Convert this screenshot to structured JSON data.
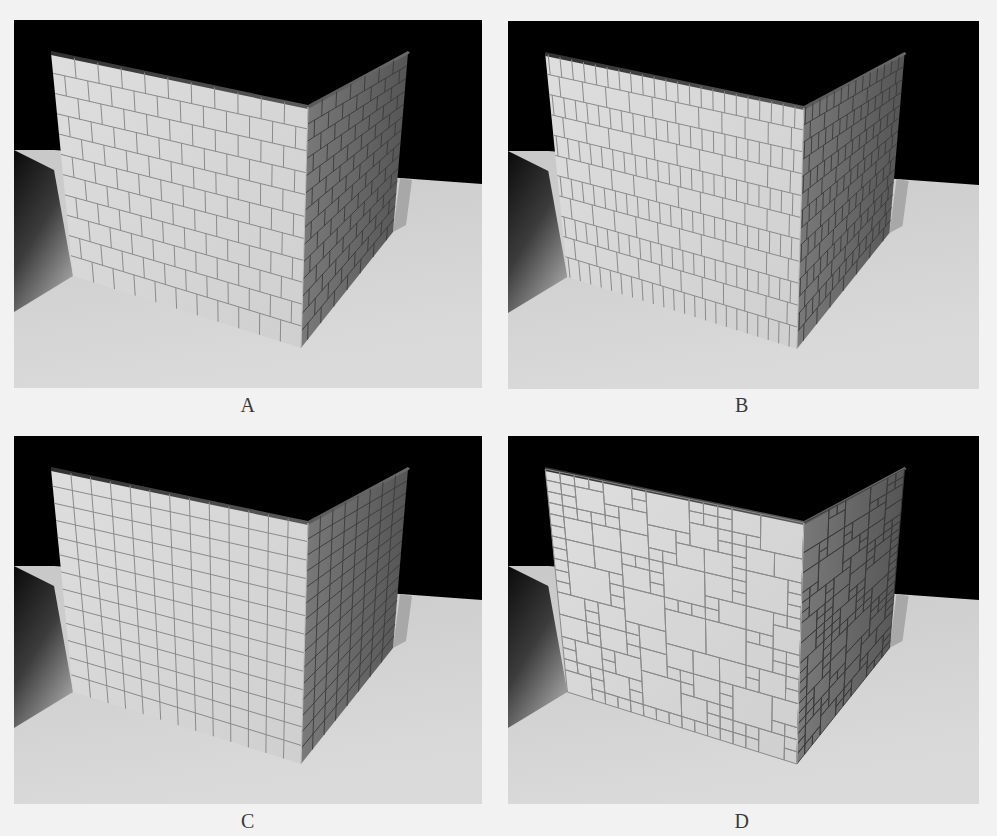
{
  "figure": {
    "top_caption_fragment": "",
    "panels": [
      {
        "id": "A",
        "label": "A",
        "pattern": "running-bond-bricks",
        "description": "Corner of two walls tiled with staggered rectangular bricks on a lit floor"
      },
      {
        "id": "B",
        "label": "B",
        "pattern": "mixed-width-bricks",
        "description": "Corner of two walls tiled with rows of narrow and wide bricks"
      },
      {
        "id": "C",
        "label": "C",
        "pattern": "square-grid",
        "description": "Corner of two walls tiled with a regular square grid"
      },
      {
        "id": "D",
        "label": "D",
        "pattern": "random-size-tiles",
        "description": "Corner of two walls tiled with a mosaic of varied-size square tiles"
      }
    ]
  },
  "colors": {
    "page_background": "#f2f2f2",
    "scene_background": "#000000",
    "floor_lit": "#d2d2d2",
    "floor_shadow": "#4a4a4a",
    "front_wall": "#d9d9d9",
    "right_wall": "#6e6e6e",
    "grout_front": "#8a8a8a",
    "grout_right": "#3a3a3a",
    "label_text": "#3a3a3a"
  }
}
